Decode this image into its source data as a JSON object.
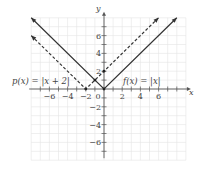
{
  "chart_data": {
    "type": "line",
    "title": "",
    "xlabel": "x",
    "ylabel": "y",
    "xlim": [
      -8,
      9
    ],
    "ylim": [
      -8,
      8
    ],
    "grid": true,
    "x_ticks": [
      -6,
      -4,
      -2,
      0,
      2,
      4,
      6
    ],
    "y_ticks": [
      -6,
      -4,
      -2,
      2,
      4,
      6
    ],
    "series": [
      {
        "name": "f(x) = |x|",
        "style": "solid",
        "points": [
          [
            -8,
            8
          ],
          [
            0,
            0
          ],
          [
            8,
            8
          ]
        ]
      },
      {
        "name": "p(x) = |x + 2|",
        "style": "dashed",
        "points": [
          [
            -8,
            6
          ],
          [
            -2,
            0
          ],
          [
            6,
            8
          ]
        ]
      }
    ],
    "annotations": [
      {
        "text": "p(x) = |x + 2|",
        "at": [
          -5.3,
          1.5
        ]
      },
      {
        "text": "f(x) = |x|",
        "at": [
          3.8,
          1.5
        ]
      }
    ],
    "marked_points": [
      [
        -2,
        0
      ],
      [
        0,
        0
      ],
      [
        -1,
        1
      ],
      [
        0,
        2
      ]
    ]
  },
  "labels": {
    "x_axis": "x",
    "y_axis": "y",
    "origin": "0",
    "p_label": "p(x) = |x + 2|",
    "f_label": "f(x) = |x|"
  }
}
